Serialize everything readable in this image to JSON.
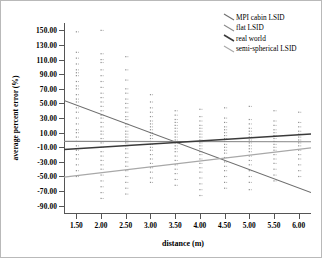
{
  "chart_data": {
    "type": "scatter",
    "title": "",
    "xlabel": "distance (m)",
    "ylabel": "average percent error (%)",
    "xlim": [
      1.25,
      6.25
    ],
    "ylim": [
      -100,
      160
    ],
    "xticks": [
      1.5,
      2.0,
      2.5,
      3.0,
      3.5,
      4.0,
      4.5,
      5.0,
      5.5,
      6.0
    ],
    "xticklabels": [
      "1.50",
      "2.00",
      "2.50",
      "3.00",
      "3.50",
      "4.00",
      "4.50",
      "5.00",
      "5.50",
      "6.00"
    ],
    "yticks": [
      150,
      130,
      110,
      90,
      70,
      50,
      30,
      10,
      -10,
      -30,
      -50,
      -70,
      -90
    ],
    "yticklabels": [
      "150.00",
      "130.00",
      "110.00",
      "90.00",
      "70.00",
      "50.00",
      "30.00",
      "10.00",
      "-10.00",
      "-30.00",
      "-50.00",
      "-70.00",
      "-90.00"
    ],
    "grid": false,
    "legend_position": "top-right",
    "series": [
      {
        "name": "MPI cabin LSID",
        "color": "#6e6e6e",
        "fit": {
          "x": [
            1.25,
            6.25
          ],
          "y": [
            54.0,
            -72.0
          ]
        },
        "points_x": [
          1.5,
          1.5,
          1.5,
          1.5,
          1.5,
          1.5,
          1.5,
          1.5,
          2.0,
          2.0,
          2.0,
          2.0,
          2.0,
          2.0,
          2.5,
          2.5,
          2.5,
          2.5,
          2.5,
          3.0,
          3.0,
          3.0,
          3.0,
          3.5,
          3.5,
          3.5,
          4.0,
          4.0,
          4.0,
          4.5,
          4.5,
          5.0,
          5.0,
          5.5,
          6.0
        ],
        "points_y": [
          148,
          112,
          92,
          74,
          70,
          52,
          30,
          10,
          118,
          108,
          72,
          52,
          30,
          10,
          64,
          40,
          28,
          12,
          4,
          34,
          22,
          12,
          2,
          20,
          10,
          2,
          14,
          6,
          -2,
          8,
          0,
          4,
          -4,
          0,
          -6
        ]
      },
      {
        "name": "flat LSID",
        "color": "#8a8a8a",
        "fit": {
          "x": [
            1.25,
            6.25
          ],
          "y": [
            -2.0,
            -2.5
          ]
        }
      },
      {
        "name": "real world",
        "color": "#3a3a3a",
        "fit": {
          "x": [
            1.25,
            6.25
          ],
          "y": [
            -13.0,
            8.0
          ]
        }
      },
      {
        "name": "semi-spherical LSID",
        "color": "#a8a8a8",
        "fit": {
          "x": [
            1.25,
            6.25
          ],
          "y": [
            -51.0,
            -11.0
          ]
        }
      }
    ],
    "scatter_columns": [
      {
        "x": 1.5,
        "values": [
          148,
          120,
          112,
          104,
          96,
          92,
          88,
          80,
          74,
          70,
          62,
          56,
          52,
          44,
          38,
          30,
          22,
          14,
          10,
          4,
          -2,
          -8,
          -14,
          -20,
          -26,
          -34,
          -42,
          -50
        ]
      },
      {
        "x": 2.0,
        "values": [
          150,
          118,
          110,
          106,
          96,
          88,
          80,
          72,
          64,
          58,
          52,
          46,
          40,
          34,
          30,
          24,
          18,
          12,
          8,
          2,
          -4,
          -10,
          -16,
          -22,
          -28,
          -34,
          -40,
          -48,
          -56,
          -64,
          -72,
          -80
        ]
      },
      {
        "x": 2.5,
        "values": [
          114,
          96,
          82,
          70,
          64,
          56,
          50,
          44,
          38,
          32,
          28,
          22,
          18,
          12,
          8,
          4,
          0,
          -4,
          -8,
          -12,
          -18,
          -24,
          -30,
          -36,
          -42,
          -50,
          -58,
          -66,
          -74
        ]
      },
      {
        "x": 3.0,
        "values": [
          62,
          52,
          44,
          38,
          32,
          26,
          22,
          18,
          14,
          10,
          6,
          2,
          -2,
          -6,
          -10,
          -14,
          -20,
          -26,
          -32,
          -38,
          -44,
          -52,
          -58
        ]
      },
      {
        "x": 3.5,
        "values": [
          40,
          34,
          28,
          24,
          20,
          16,
          12,
          8,
          4,
          0,
          -4,
          -8,
          -12,
          -16,
          -22,
          -28,
          -34,
          -40,
          -46,
          -54,
          -62
        ]
      },
      {
        "x": 4.0,
        "values": [
          42,
          32,
          26,
          20,
          16,
          12,
          8,
          4,
          0,
          -4,
          -8,
          -12,
          -16,
          -20,
          -26,
          -32,
          -38,
          -44,
          -52,
          -60,
          -68,
          -76
        ]
      },
      {
        "x": 4.5,
        "values": [
          44,
          30,
          24,
          18,
          14,
          10,
          6,
          2,
          -2,
          -6,
          -10,
          -14,
          -18,
          -24,
          -30,
          -36,
          -42,
          -50,
          -58,
          -66
        ]
      },
      {
        "x": 5.0,
        "values": [
          46,
          28,
          22,
          16,
          12,
          8,
          4,
          0,
          -4,
          -8,
          -12,
          -16,
          -22,
          -28,
          -34,
          -42,
          -50,
          -58,
          -68
        ]
      },
      {
        "x": 5.5,
        "values": [
          40,
          26,
          20,
          14,
          10,
          6,
          2,
          -2,
          -6,
          -10,
          -14,
          -20,
          -26,
          -32,
          -40,
          -48,
          -56
        ]
      },
      {
        "x": 6.0,
        "values": [
          38,
          24,
          18,
          12,
          8,
          4,
          0,
          -4,
          -8,
          -14,
          -20,
          -26,
          -34,
          -42,
          -50
        ]
      }
    ]
  },
  "legend": {
    "items": [
      {
        "label": "MPI cabin LSID"
      },
      {
        "label": "flat LSID"
      },
      {
        "label": "real world"
      },
      {
        "label": "semi-spherical LSID"
      }
    ]
  },
  "axes": {
    "xlabel": "distance (m)",
    "ylabel": "average percent error (%)"
  }
}
